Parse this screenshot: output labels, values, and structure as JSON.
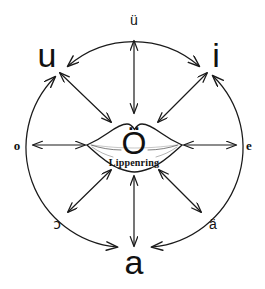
{
  "diagram": {
    "background_color": "#ffffff",
    "stroke_color": "#1a1a1a",
    "center": {
      "vowel": "Ö",
      "caption": "Lippenring",
      "icon": "lips-icon"
    },
    "vowels": [
      {
        "id": "ue",
        "label": "ü",
        "position": "top",
        "size": "minor",
        "x": 134,
        "y": 20
      },
      {
        "id": "i",
        "label": "i",
        "position": "top-right",
        "size": "major",
        "x": 216,
        "y": 55
      },
      {
        "id": "e",
        "label": "e",
        "position": "right",
        "size": "minor",
        "x": 249,
        "y": 145
      },
      {
        "id": "ae",
        "label": "ä",
        "position": "bottom-right",
        "size": "minor",
        "x": 213,
        "y": 224
      },
      {
        "id": "a",
        "label": "a",
        "position": "bottom",
        "size": "major",
        "x": 134,
        "y": 262
      },
      {
        "id": "openo",
        "label": "ɔ",
        "position": "bottom-left",
        "size": "minor",
        "x": 57,
        "y": 224
      },
      {
        "id": "o",
        "label": "o",
        "position": "left",
        "size": "minor",
        "x": 17,
        "y": 145
      },
      {
        "id": "u",
        "label": "u",
        "position": "top-left",
        "size": "major",
        "x": 47,
        "y": 55
      }
    ],
    "radial_arrows": [
      {
        "id": "center-to-ue",
        "from": "center",
        "to": "ü",
        "direction": "double",
        "angle_deg": 270
      },
      {
        "id": "center-to-i",
        "from": "center",
        "to": "i",
        "direction": "double",
        "angle_deg": 315
      },
      {
        "id": "center-to-e",
        "from": "center",
        "to": "e",
        "direction": "double",
        "angle_deg": 0
      },
      {
        "id": "center-to-ae",
        "from": "center",
        "to": "ä",
        "direction": "double",
        "angle_deg": 45
      },
      {
        "id": "center-to-a",
        "from": "center",
        "to": "a",
        "direction": "double",
        "angle_deg": 90
      },
      {
        "id": "center-to-openo",
        "from": "center",
        "to": "ɔ",
        "direction": "double",
        "angle_deg": 135
      },
      {
        "id": "center-to-o",
        "from": "center",
        "to": "o",
        "direction": "double",
        "angle_deg": 180
      },
      {
        "id": "center-to-u",
        "from": "center",
        "to": "u",
        "direction": "double",
        "angle_deg": 225
      }
    ],
    "perimeter_arcs": [
      {
        "id": "arc-u-to-i",
        "from": "u",
        "through": "ü",
        "to": "i",
        "arrowheads": "both"
      },
      {
        "id": "arc-i-to-a",
        "from": "i",
        "through": "e, ä",
        "to": "a",
        "arrowheads": "both"
      },
      {
        "id": "arc-a-to-u",
        "from": "a",
        "through": "ɔ, o",
        "to": "u",
        "arrowheads": "both"
      }
    ]
  }
}
